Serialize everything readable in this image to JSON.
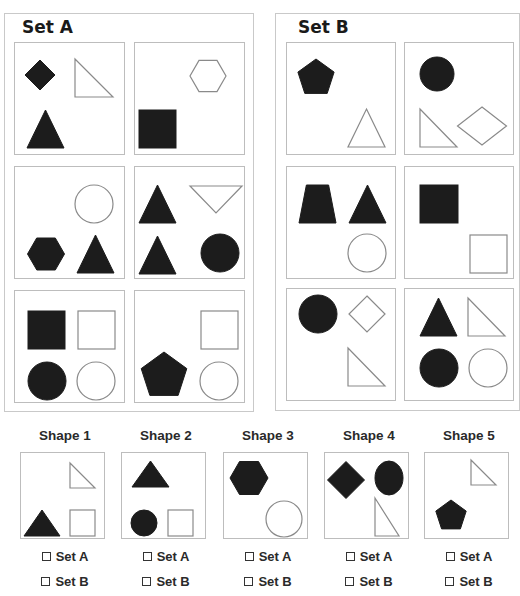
{
  "colors": {
    "fill": "#1c1c1c",
    "stroke": "#8a8a8a",
    "border": "#bdbdbd"
  },
  "sets": [
    {
      "id": "A",
      "title": "Set A",
      "cells": [
        {
          "shapes": [
            {
              "type": "diamond",
              "filled": true,
              "x": 25,
              "y": 32,
              "s": 30
            },
            {
              "type": "right-triangle",
              "filled": false,
              "x": 60,
              "y": 16,
              "w": 38,
              "h": 38
            },
            {
              "type": "triangle",
              "filled": true,
              "x": 12,
              "y": 67,
              "w": 37,
              "h": 38
            }
          ]
        },
        {
          "shapes": [
            {
              "type": "hexagon",
              "filled": false,
              "x": 73,
              "y": 33,
              "s": 36
            },
            {
              "type": "square",
              "filled": true,
              "x": 4,
              "y": 67,
              "w": 37,
              "h": 38
            }
          ]
        },
        {
          "shapes": [
            {
              "type": "circle",
              "filled": false,
              "x": 79,
              "y": 37,
              "r": 19
            },
            {
              "type": "hexagon",
              "filled": true,
              "x": 31,
              "y": 87,
              "s": 37
            },
            {
              "type": "triangle",
              "filled": true,
              "x": 62,
              "y": 68,
              "w": 37,
              "h": 38
            }
          ]
        },
        {
          "shapes": [
            {
              "type": "triangle",
              "filled": true,
              "x": 4,
              "y": 18,
              "w": 37,
              "h": 38
            },
            {
              "type": "inverted-triangle",
              "filled": false,
              "x": 55,
              "y": 19,
              "w": 52,
              "h": 27
            },
            {
              "type": "triangle",
              "filled": true,
              "x": 4,
              "y": 69,
              "w": 37,
              "h": 38
            },
            {
              "type": "circle",
              "filled": true,
              "x": 85,
              "y": 86,
              "r": 19
            }
          ]
        },
        {
          "shapes": [
            {
              "type": "square",
              "filled": true,
              "x": 13,
              "y": 20,
              "w": 37,
              "h": 38
            },
            {
              "type": "square",
              "filled": false,
              "x": 63,
              "y": 20,
              "w": 37,
              "h": 38
            },
            {
              "type": "circle",
              "filled": true,
              "x": 32,
              "y": 90,
              "r": 19
            },
            {
              "type": "circle",
              "filled": false,
              "x": 81,
              "y": 90,
              "r": 19
            }
          ]
        },
        {
          "shapes": [
            {
              "type": "square",
              "filled": false,
              "x": 66,
              "y": 20,
              "w": 37,
              "h": 38
            },
            {
              "type": "pentagon",
              "filled": true,
              "x": 29,
              "y": 85,
              "s": 48
            },
            {
              "type": "circle",
              "filled": false,
              "x": 84,
              "y": 90,
              "r": 19
            }
          ]
        }
      ]
    },
    {
      "id": "B",
      "title": "Set B",
      "cells": [
        {
          "shapes": [
            {
              "type": "pentagon",
              "filled": true,
              "x": 29,
              "y": 35,
              "s": 38
            },
            {
              "type": "triangle",
              "filled": false,
              "x": 61,
              "y": 66,
              "w": 37,
              "h": 38
            }
          ]
        },
        {
          "shapes": [
            {
              "type": "circle",
              "filled": true,
              "x": 32,
              "y": 31,
              "r": 17
            },
            {
              "type": "right-triangle",
              "filled": false,
              "x": 15,
              "y": 66,
              "w": 37,
              "h": 38
            },
            {
              "type": "diamond-wide",
              "filled": false,
              "x": 77,
              "y": 83,
              "w": 49,
              "h": 38
            }
          ]
        },
        {
          "shapes": [
            {
              "type": "trapezoid",
              "filled": true,
              "x": 12,
              "y": 18,
              "w": 37,
              "h": 38
            },
            {
              "type": "triangle",
              "filled": true,
              "x": 62,
              "y": 18,
              "w": 37,
              "h": 38
            },
            {
              "type": "circle",
              "filled": false,
              "x": 80,
              "y": 86,
              "r": 19
            }
          ]
        },
        {
          "shapes": [
            {
              "type": "square",
              "filled": true,
              "x": 15,
              "y": 18,
              "w": 38,
              "h": 38
            },
            {
              "type": "square",
              "filled": false,
              "x": 65,
              "y": 68,
              "w": 37,
              "h": 38
            }
          ]
        },
        {
          "shapes": [
            {
              "type": "circle",
              "filled": true,
              "x": 31,
              "y": 25,
              "r": 19
            },
            {
              "type": "diamond",
              "filled": false,
              "x": 80,
              "y": 25,
              "s": 36
            },
            {
              "type": "right-triangle",
              "filled": false,
              "x": 61,
              "y": 59,
              "w": 37,
              "h": 38
            }
          ]
        },
        {
          "shapes": [
            {
              "type": "triangle",
              "filled": true,
              "x": 15,
              "y": 9,
              "w": 37,
              "h": 38
            },
            {
              "type": "right-triangle",
              "filled": false,
              "x": 63,
              "y": 9,
              "w": 37,
              "h": 38
            },
            {
              "type": "circle",
              "filled": true,
              "x": 34,
              "y": 79,
              "r": 19
            },
            {
              "type": "circle",
              "filled": false,
              "x": 83,
              "y": 79,
              "r": 19
            }
          ]
        }
      ]
    }
  ],
  "questions": [
    {
      "title": "Shape 1",
      "options": [
        "Set A",
        "Set B"
      ],
      "shapes": [
        {
          "type": "right-triangle",
          "filled": false,
          "x": 49,
          "y": 10,
          "w": 25,
          "h": 25
        },
        {
          "type": "triangle",
          "filled": true,
          "x": 3,
          "y": 57,
          "w": 36,
          "h": 26
        },
        {
          "type": "square",
          "filled": false,
          "x": 49,
          "y": 57,
          "w": 25,
          "h": 26
        }
      ]
    },
    {
      "title": "Shape 2",
      "options": [
        "Set A",
        "Set B"
      ],
      "shapes": [
        {
          "type": "triangle",
          "filled": true,
          "x": 10,
          "y": 8,
          "w": 37,
          "h": 26
        },
        {
          "type": "circle",
          "filled": true,
          "x": 22,
          "y": 70,
          "r": 13
        },
        {
          "type": "square",
          "filled": false,
          "x": 46,
          "y": 57,
          "w": 25,
          "h": 26
        }
      ]
    },
    {
      "title": "Shape 3",
      "options": [
        "Set A",
        "Set B"
      ],
      "shapes": [
        {
          "type": "hexagon",
          "filled": true,
          "x": 25,
          "y": 25,
          "s": 38
        },
        {
          "type": "circle",
          "filled": false,
          "x": 60,
          "y": 66,
          "r": 18
        }
      ]
    },
    {
      "title": "Shape 4",
      "options": [
        "Set A",
        "Set B"
      ],
      "shapes": [
        {
          "type": "diamond",
          "filled": true,
          "x": 21,
          "y": 27,
          "s": 37
        },
        {
          "type": "ellipse",
          "filled": true,
          "x": 64,
          "y": 25,
          "rx": 14,
          "ry": 17
        },
        {
          "type": "right-triangle",
          "filled": false,
          "x": 50,
          "y": 45,
          "w": 24,
          "h": 38
        }
      ]
    },
    {
      "title": "Shape 5",
      "options": [
        "Set A",
        "Set B"
      ],
      "shapes": [
        {
          "type": "right-triangle",
          "filled": false,
          "x": 46,
          "y": 7,
          "w": 25,
          "h": 25
        },
        {
          "type": "pentagon",
          "filled": true,
          "x": 26,
          "y": 63,
          "s": 32
        }
      ]
    }
  ]
}
